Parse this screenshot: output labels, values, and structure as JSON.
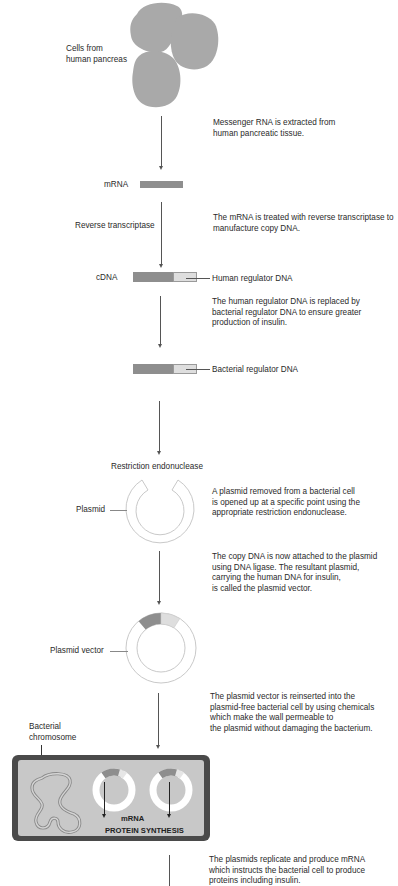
{
  "diagram": {
    "colors": {
      "cells": "#a9a9a9",
      "dna_dark": "#8e8e8e",
      "dna_light": "#dedede",
      "plasmid_ring": "#c9c9c9",
      "cell_wall": "#4a4a4a",
      "cytoplasm": "#c8c8c8",
      "line": "#555555"
    },
    "labels": {
      "cells": [
        "Cells from",
        "human pancreas"
      ],
      "mrna": "mRNA",
      "reverse_transcriptase": "Reverse transcriptase",
      "cdna": "cDNA",
      "human_regulator": "Human regulator DNA",
      "bacterial_regulator": "Bacterial regulator DNA",
      "restriction_endonuclease": "Restriction endonuclease",
      "plasmid": "Plasmid",
      "plasmid_vector": "Plasmid vector",
      "bacterial_chromosome": [
        "Bacterial",
        "chromosome"
      ],
      "cell_mrna": "mRNA",
      "protein_synthesis": "PROTEIN SYNTHESIS"
    },
    "descriptions": [
      "Messenger RNA is extracted from\nhuman pancreatic tissue.",
      "The mRNA is treated with reverse transcriptase to\nmanufacture copy DNA.",
      "The human regulator DNA is replaced by\nbacterial regulator DNA to ensure greater\nproduction of insulin.",
      "A plasmid removed from a bacterial cell\nis opened up at a specific point using the\nappropriate restriction endonuclease.",
      "The copy DNA is now attached to the plasmid\nusing DNA ligase.  The resultant plasmid,\ncarrying the human DNA for insulin,\n is called the plasmid vector.",
      "The plasmid vector is reinserted into the\nplasmid-free bacterial cell by using chemicals\nwhich make the wall permeable to\nthe plasmid without damaging the bacterium.",
      "The plasmids replicate and produce mRNA\nwhich instructs the bacterial cell to produce\nproteins including insulin."
    ]
  }
}
